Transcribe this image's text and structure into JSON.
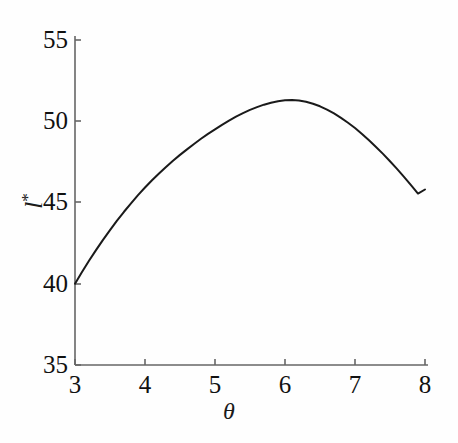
{
  "chart_data": {
    "type": "line",
    "title": "",
    "subtitle": "",
    "xlabel": "θ",
    "ylabel": "l*",
    "ylabel_base": "l",
    "ylabel_sup": "*",
    "xlim": [
      3,
      8
    ],
    "ylim": [
      35,
      55
    ],
    "grid": false,
    "legend": null,
    "line_color": "#1a1a1a",
    "line_width_px": 2.0,
    "background_color": "#ffffff",
    "axis_color": "#555555",
    "xticks": [
      3,
      4,
      5,
      6,
      7,
      8
    ],
    "xtick_labels": [
      "3",
      "4",
      "5",
      "6",
      "7",
      "8"
    ],
    "yticks": [
      35,
      40,
      45,
      50,
      55
    ],
    "ytick_labels": [
      "35",
      "40",
      "45",
      "50",
      "55"
    ],
    "series": [
      {
        "name": "l*(θ)",
        "x": [
          3.0,
          3.1,
          3.2,
          3.3,
          3.4,
          3.5,
          3.6,
          3.7,
          3.8,
          3.9,
          4.0,
          4.1,
          4.2,
          4.3,
          4.4,
          4.5,
          4.6,
          4.7,
          4.8,
          4.9,
          5.0,
          5.1,
          5.2,
          5.3,
          5.4,
          5.5,
          5.6,
          5.7,
          5.8,
          5.9,
          6.0,
          6.1,
          6.2,
          6.3,
          6.4,
          6.5,
          6.6,
          6.7,
          6.8,
          6.9,
          7.0,
          7.1,
          7.2,
          7.3,
          7.4,
          7.5,
          7.6,
          7.7,
          7.8,
          7.9,
          8.0
        ],
        "y": [
          40.0,
          40.72,
          41.41,
          42.07,
          42.7,
          43.3,
          43.88,
          44.43,
          44.95,
          45.45,
          45.92,
          46.37,
          46.79,
          47.19,
          47.57,
          47.93,
          48.27,
          48.6,
          48.92,
          49.22,
          49.5,
          49.78,
          50.04,
          50.28,
          50.5,
          50.7,
          50.87,
          51.02,
          51.14,
          51.23,
          51.29,
          51.31,
          51.28,
          51.2,
          51.08,
          50.92,
          50.72,
          50.48,
          50.21,
          49.91,
          49.58,
          49.22,
          48.83,
          48.42,
          47.99,
          47.54,
          47.07,
          46.58,
          46.07,
          45.55,
          45.8
        ]
      }
    ],
    "annotations": [],
    "peak": {
      "x": 5.6,
      "y": 51.3
    }
  },
  "axes": {
    "y_label_text": "l",
    "y_label_superscript": "*",
    "x_label_text": "θ"
  }
}
